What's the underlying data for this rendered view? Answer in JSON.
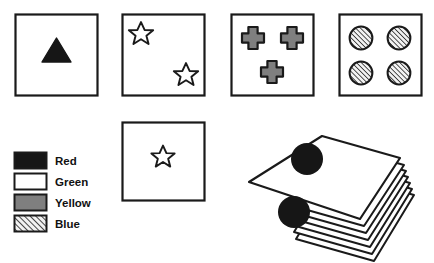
{
  "figure": {
    "background_color": "#ffffff",
    "line_color": "#1a1a1a",
    "fill_black": "#161616",
    "fill_white": "#ffffff",
    "fill_gray": "#7f7f7f",
    "hatch_color": "#1a1a1a",
    "hatch_background": "#f2f2f2"
  },
  "cards": [
    {
      "id": "card-1",
      "shape": "triangle",
      "count": 1,
      "color_name": "Red",
      "fill_style": "solid-black",
      "x": 15,
      "y": 14,
      "w": 83,
      "h": 82
    },
    {
      "id": "card-2",
      "shape": "star",
      "count": 2,
      "color_name": "Green",
      "fill_style": "white",
      "x": 122,
      "y": 14,
      "w": 83,
      "h": 82
    },
    {
      "id": "card-3",
      "shape": "cross",
      "count": 3,
      "color_name": "Yellow",
      "fill_style": "gray",
      "x": 231,
      "y": 14,
      "w": 83,
      "h": 82
    },
    {
      "id": "card-4",
      "shape": "circle",
      "count": 4,
      "color_name": "Blue",
      "fill_style": "hatched",
      "x": 339,
      "y": 14,
      "w": 83,
      "h": 82
    },
    {
      "id": "card-5",
      "shape": "star",
      "count": 1,
      "color_name": "Green",
      "fill_style": "white",
      "x": 122,
      "y": 122,
      "w": 83,
      "h": 79
    }
  ],
  "legend": {
    "items": [
      {
        "label": "Red",
        "fill_style": "solid-black"
      },
      {
        "label": "Green",
        "fill_style": "white"
      },
      {
        "label": "Yellow",
        "fill_style": "gray"
      },
      {
        "label": "Blue",
        "fill_style": "hatched"
      }
    ],
    "swatch": {
      "x": 14,
      "y": 152,
      "w": 33,
      "h": 17,
      "gap": 21
    },
    "label_x": 55
  },
  "deck": {
    "id": "card-deck",
    "top_card": {
      "shape": "circle",
      "count": 2,
      "color_name": "Red",
      "fill_style": "solid-black"
    },
    "cards_beneath": 6,
    "rotation_degrees": -20
  }
}
